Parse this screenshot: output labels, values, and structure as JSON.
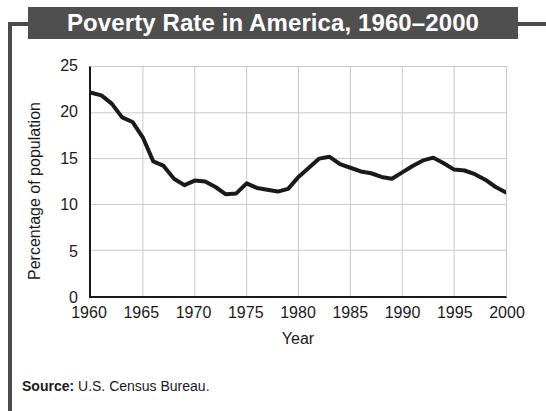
{
  "title": "Poverty Rate in America, 1960–2000",
  "source": {
    "label": "Source:",
    "value": " U.S. Census Bureau."
  },
  "colors": {
    "banner_bg": "#4f4f4f",
    "banner_text": "#ffffff",
    "frame_rule": "#4a4a4a",
    "axis": "#1a1a1a",
    "gridline": "#c9c9c9",
    "series_line": "#1a1a1a"
  },
  "axes": {
    "y_label": "Percentage of population",
    "x_label": "Year",
    "y_ticks": [
      "0",
      "5",
      "10",
      "15",
      "20",
      "25"
    ],
    "x_ticks": [
      "1960",
      "1965",
      "1970",
      "1975",
      "1980",
      "1985",
      "1990",
      "1995",
      "2000"
    ]
  },
  "chart_data": {
    "type": "line",
    "title": "Poverty Rate in America, 1960–2000",
    "subtitle": "",
    "xlabel": "Year",
    "ylabel": "Percentage of population",
    "xlim": [
      1960,
      2000
    ],
    "ylim": [
      0,
      25
    ],
    "x_tick_values": [
      1960,
      1965,
      1970,
      1975,
      1980,
      1985,
      1990,
      1995,
      2000
    ],
    "y_tick_values": [
      0,
      5,
      10,
      15,
      20,
      25
    ],
    "grid": true,
    "legend": false,
    "legend_position": "none",
    "annotations": [],
    "series": [
      {
        "name": "Poverty rate",
        "x": [
          1960,
          1961,
          1962,
          1963,
          1964,
          1965,
          1966,
          1967,
          1968,
          1969,
          1970,
          1971,
          1972,
          1973,
          1974,
          1975,
          1976,
          1977,
          1978,
          1979,
          1980,
          1981,
          1982,
          1983,
          1984,
          1985,
          1986,
          1987,
          1988,
          1989,
          1990,
          1991,
          1992,
          1993,
          1994,
          1995,
          1996,
          1997,
          1998,
          1999,
          2000
        ],
        "values": [
          22.2,
          21.9,
          21.0,
          19.5,
          19.0,
          17.3,
          14.7,
          14.2,
          12.8,
          12.1,
          12.6,
          12.5,
          11.9,
          11.1,
          11.2,
          12.3,
          11.8,
          11.6,
          11.4,
          11.7,
          13.0,
          14.0,
          15.0,
          15.2,
          14.4,
          14.0,
          13.6,
          13.4,
          13.0,
          12.8,
          13.5,
          14.2,
          14.8,
          15.1,
          14.5,
          13.8,
          13.7,
          13.3,
          12.7,
          11.9,
          11.3
        ]
      }
    ]
  }
}
